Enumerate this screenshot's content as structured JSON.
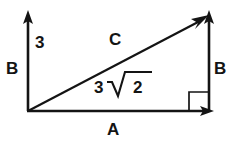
{
  "diagram": {
    "type": "right-triangle-vector-diagram",
    "background_color": "#ffffff",
    "stroke_color": "#141414",
    "labels": {
      "vertical_leg_magnitude": "3",
      "vertical_leg_left": "B",
      "vertical_leg_right": "B",
      "horizontal_leg": "A",
      "hypotenuse": "C",
      "hypotenuse_magnitude_coefficient": "3",
      "hypotenuse_magnitude_radicand": "2"
    },
    "geometry": {
      "origin": [
        28,
        111
      ],
      "vertical_arrow_tip": [
        28,
        12
      ],
      "horizontal_arrow_tip": [
        212,
        111
      ],
      "right_vertical_base": [
        209,
        111
      ],
      "right_vertical_tip": [
        209,
        12
      ],
      "hypotenuse_tip": [
        208,
        16
      ],
      "right_angle_marker": [
        189,
        92,
        20,
        19
      ]
    }
  }
}
